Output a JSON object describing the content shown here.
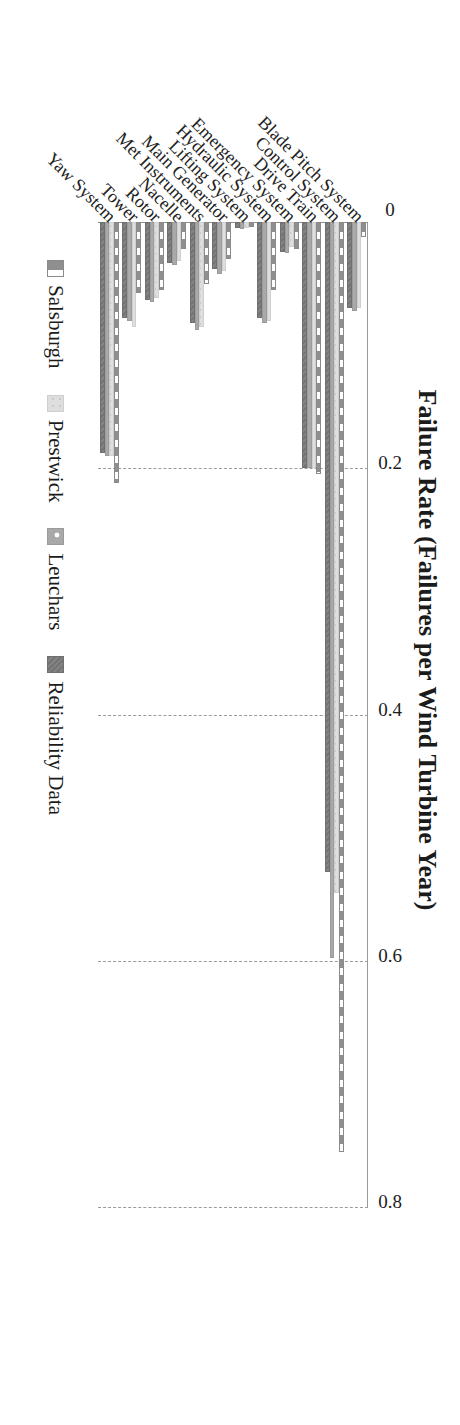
{
  "chart_data": {
    "type": "bar",
    "orientation": "horizontal",
    "title": "Failure Rate (Failures per Wind Turbine Year)",
    "xlabel": "Failure Rate (Failures per Wind Turbine Year)",
    "ylabel": "",
    "xlim": [
      0,
      0.8
    ],
    "xticks": [
      "0",
      "0.2",
      "0.4",
      "0.6",
      "0.8"
    ],
    "xtick_values": [
      0,
      0.2,
      0.4,
      0.6,
      0.8
    ],
    "grid": true,
    "legend_position": "bottom",
    "categories": [
      "Blade Pitch System",
      "Control System",
      "Drive Train",
      "Emergency System",
      "Hydraulic System",
      "Lifting System",
      "Main Generator",
      "Met Instruments",
      "Nacelle",
      "Rotor",
      "Tower",
      "Yaw System"
    ],
    "series": [
      {
        "name": "Salsburgh",
        "color": "#9c9c9c",
        "values": [
          0.012,
          0.755,
          0.205,
          0.022,
          0.055,
          0.004,
          0.03,
          0.05,
          0.022,
          0.055,
          0.058,
          0.212
        ]
      },
      {
        "name": "Prestwick",
        "color": "#dedede",
        "values": [
          0.07,
          0.545,
          0.2,
          0.02,
          0.08,
          0.005,
          0.04,
          0.085,
          0.032,
          0.062,
          0.085,
          0.19
        ]
      },
      {
        "name": "Leuchars",
        "color": "#a9a9a9",
        "values": [
          0.072,
          0.598,
          0.2,
          0.025,
          0.082,
          0.006,
          0.042,
          0.088,
          0.035,
          0.065,
          0.08,
          0.19
        ]
      },
      {
        "name": "Reliability Data",
        "color": "#7d7d7d",
        "values": [
          0.07,
          0.528,
          0.2,
          0.024,
          0.078,
          0.005,
          0.038,
          0.082,
          0.033,
          0.063,
          0.078,
          0.188
        ]
      }
    ]
  },
  "legend": {
    "items": [
      {
        "label": "Salsburgh"
      },
      {
        "label": "Prestwick"
      },
      {
        "label": "Leuchars"
      },
      {
        "label": "Reliability Data"
      }
    ]
  }
}
